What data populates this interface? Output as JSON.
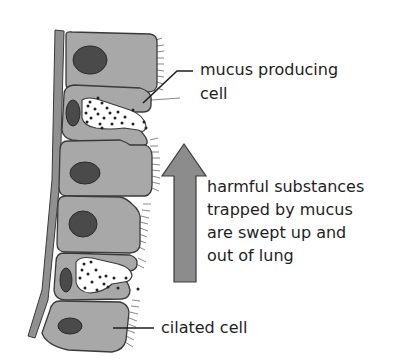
{
  "diagram": {
    "colors": {
      "cell_fill": "#a8a8a8",
      "cell_stroke": "#3a3a3a",
      "nucleus": "#4a4a4a",
      "mucus": "#ffffff",
      "arrow": "#8c8c8c",
      "membrane": "#909090"
    },
    "labels": {
      "mucus_cell": [
        "mucus producing",
        "cell"
      ],
      "arrow_caption": [
        "harmful substances",
        "trapped by mucus",
        "are swept up and",
        "out of lung"
      ],
      "ciliated_cell": "cilated cell"
    },
    "cells": [
      {
        "type": "ciliated",
        "order": 1
      },
      {
        "type": "goblet",
        "order": 2
      },
      {
        "type": "ciliated",
        "order": 3
      },
      {
        "type": "ciliated",
        "order": 4
      },
      {
        "type": "goblet",
        "order": 5
      },
      {
        "type": "ciliated",
        "order": 6
      }
    ],
    "arrow_direction": "up"
  }
}
